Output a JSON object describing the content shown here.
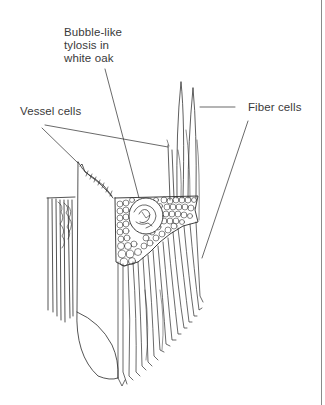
{
  "figure": {
    "labels": {
      "tylosis": "Bubble-like tylosis in white oak",
      "tylosis_lines": [
        "Bubble-like",
        "tylosis in",
        "white oak"
      ],
      "vessel": "Vessel cells",
      "fiber": "Fiber cells"
    },
    "colors": {
      "background": "#ffffff",
      "ink": "#2a2a2a",
      "label_text": "#3a3a3a",
      "border_rule": "#8a8a8a"
    }
  }
}
